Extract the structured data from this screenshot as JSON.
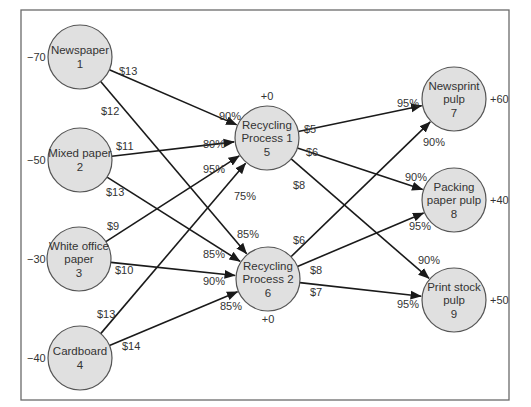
{
  "diagram": {
    "nodes": [
      {
        "id": 1,
        "lines": [
          "Newspaper",
          "1"
        ],
        "supply": "−70",
        "cx": 80,
        "cy": 57,
        "supply_x": 27,
        "supply_y": 61,
        "supply_anchor": "start"
      },
      {
        "id": 2,
        "lines": [
          "Mixed paper",
          "2"
        ],
        "supply": "−50",
        "cx": 80,
        "cy": 160,
        "supply_x": 27,
        "supply_y": 164,
        "supply_anchor": "start"
      },
      {
        "id": 3,
        "lines": [
          "White office",
          "paper",
          "3"
        ],
        "supply": "−30",
        "cx": 79,
        "cy": 259,
        "supply_x": 27,
        "supply_y": 263,
        "supply_anchor": "start"
      },
      {
        "id": 4,
        "lines": [
          "Cardboard",
          "4"
        ],
        "supply": "−40",
        "cx": 80,
        "cy": 358,
        "supply_x": 27,
        "supply_y": 362,
        "supply_anchor": "start"
      },
      {
        "id": 5,
        "lines": [
          "Recycling",
          "Process 1",
          "5"
        ],
        "supply": "+0",
        "cx": 267,
        "cy": 138,
        "supply_x": 267,
        "supply_y": 100,
        "supply_anchor": "middle"
      },
      {
        "id": 6,
        "lines": [
          "Recycling",
          "Process 2",
          "6"
        ],
        "supply": "+0",
        "cx": 268,
        "cy": 279,
        "supply_x": 268,
        "supply_y": 323,
        "supply_anchor": "middle"
      },
      {
        "id": 7,
        "lines": [
          "Newsprint",
          "pulp",
          "7"
        ],
        "supply": "+60",
        "cx": 454,
        "cy": 99,
        "supply_x": 490,
        "supply_y": 103,
        "supply_anchor": "start"
      },
      {
        "id": 8,
        "lines": [
          "Packing",
          "paper pulp",
          "8"
        ],
        "supply": "+40",
        "cx": 454,
        "cy": 200,
        "supply_x": 490,
        "supply_y": 204,
        "supply_anchor": "start"
      },
      {
        "id": 9,
        "lines": [
          "Print stock",
          "pulp",
          "9"
        ],
        "supply": "+50",
        "cx": 454,
        "cy": 300,
        "supply_x": 490,
        "supply_y": 304,
        "supply_anchor": "start"
      }
    ],
    "edges": [
      {
        "from": 1,
        "to": 5,
        "cost": "$13",
        "yield": "90%",
        "cost_x": 119,
        "cost_y": 75,
        "yield_x": 219,
        "yield_y": 120
      },
      {
        "from": 1,
        "to": 6,
        "cost": "$12",
        "yield": "85%",
        "cost_x": 101,
        "cost_y": 115,
        "yield_x": 237,
        "yield_y": 238
      },
      {
        "from": 2,
        "to": 5,
        "cost": "$11",
        "yield": "80%",
        "cost_x": 116,
        "cost_y": 150,
        "yield_x": 203,
        "yield_y": 148
      },
      {
        "from": 2,
        "to": 6,
        "cost": "$13",
        "yield": "85%",
        "cost_x": 106,
        "cost_y": 196,
        "yield_x": 203,
        "yield_y": 258
      },
      {
        "from": 3,
        "to": 5,
        "cost": "$9",
        "yield": "95%",
        "cost_x": 107,
        "cost_y": 230,
        "yield_x": 203,
        "yield_y": 173
      },
      {
        "from": 3,
        "to": 6,
        "cost": "$10",
        "yield": "90%",
        "cost_x": 115,
        "cost_y": 274,
        "yield_x": 203,
        "yield_y": 285
      },
      {
        "from": 4,
        "to": 5,
        "cost": "$13",
        "yield": "75%",
        "cost_x": 97,
        "cost_y": 318,
        "yield_x": 234,
        "yield_y": 200
      },
      {
        "from": 4,
        "to": 6,
        "cost": "$14",
        "yield": "85%",
        "cost_x": 122,
        "cost_y": 350,
        "yield_x": 220,
        "yield_y": 310
      },
      {
        "from": 5,
        "to": 7,
        "cost": "$5",
        "yield": "95%",
        "cost_x": 304,
        "cost_y": 133,
        "yield_x": 397,
        "yield_y": 107
      },
      {
        "from": 5,
        "to": 8,
        "cost": "$6",
        "yield": "90%",
        "cost_x": 306,
        "cost_y": 156,
        "yield_x": 405,
        "yield_y": 181
      },
      {
        "from": 5,
        "to": 9,
        "cost": "$8",
        "yield": "90%",
        "cost_x": 293,
        "cost_y": 189,
        "yield_x": 418,
        "yield_y": 264
      },
      {
        "from": 6,
        "to": 7,
        "cost": "$6",
        "yield": "90%",
        "cost_x": 293,
        "cost_y": 244,
        "yield_x": 423,
        "yield_y": 146
      },
      {
        "from": 6,
        "to": 8,
        "cost": "$8",
        "yield": "95%",
        "cost_x": 310,
        "cost_y": 274,
        "yield_x": 409,
        "yield_y": 230
      },
      {
        "from": 6,
        "to": 9,
        "cost": "$7",
        "yield": "95%",
        "cost_x": 310,
        "cost_y": 296,
        "yield_x": 397,
        "yield_y": 308
      }
    ]
  },
  "style": {
    "node_fill": "#e0e0e0",
    "node_stroke": "#555555",
    "edge_color": "#1a1a1a",
    "frame_color": "#6a6a6a",
    "node_radius": 32
  }
}
